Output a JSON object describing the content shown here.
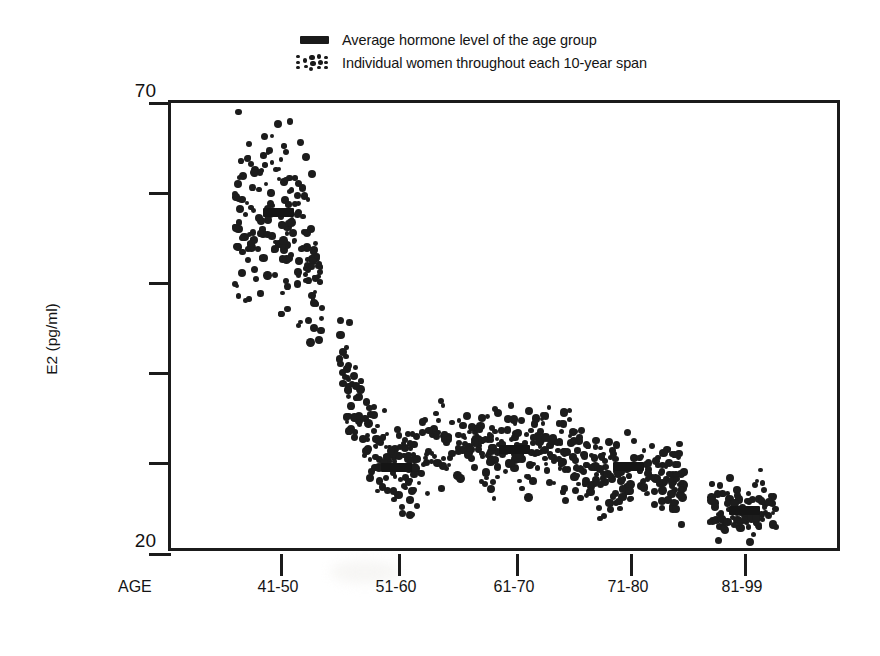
{
  "legend": {
    "items": [
      {
        "marker": "mean-bar-swatch",
        "label": "Average hormone level of the age group"
      },
      {
        "marker": "dot-cloud-swatch",
        "label": "Individual women throughout each 10-year span"
      }
    ]
  },
  "axes": {
    "y_title": "E2 (pg/ml)",
    "y_tick_top": "70",
    "y_tick_bottom": "20",
    "x_axis_name": "AGE"
  },
  "chart_data": {
    "type": "scatter",
    "title": "",
    "xlabel": "AGE",
    "ylabel": "E2 (pg/ml)",
    "ylim": [
      20,
      70
    ],
    "ytick_values": [
      20,
      30,
      40,
      50,
      60,
      70
    ],
    "ytick_labels_shown": [
      "20",
      "70"
    ],
    "grid": false,
    "legend_position": "top-center",
    "categories": [
      "41-50",
      "51-60",
      "61-70",
      "71-80",
      "81-99"
    ],
    "series": [
      {
        "name": "Average hormone level of the age group",
        "type": "mean-marker",
        "values": [
          57.5,
          29.3,
          31.3,
          29.4,
          24.5
        ]
      },
      {
        "name": "Individual women throughout each 10-year span",
        "type": "point-cloud",
        "cloud_centers": [
          57.5,
          29.3,
          31.3,
          29.4,
          24.5
        ],
        "cloud_spread": [
          7.5,
          3.6,
          4.0,
          3.4,
          2.6
        ],
        "n_points_approx": [
          190,
          185,
          190,
          185,
          90
        ],
        "note": "Dense band falls steeply from the 41-50 group through the 51-60 group, then plateaus near 30 pg/ml and drifts down to about 24 pg/ml by 81-99."
      }
    ]
  }
}
